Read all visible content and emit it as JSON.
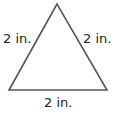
{
  "figure": {
    "shape": "equilateral-triangle",
    "stroke_color": "#555555",
    "sides": {
      "left": "2 in.",
      "right": "2 in.",
      "bottom": "2 in."
    }
  }
}
